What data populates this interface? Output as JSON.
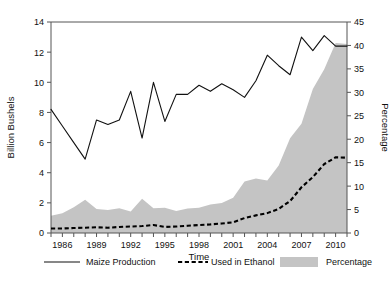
{
  "chart_data": {
    "type": "line",
    "title": "",
    "xlabel": "Time",
    "ylabel": "Billion Bushels",
    "y2label": "Percentage",
    "grid": false,
    "legend_position": "bottom",
    "xlim": [
      1985,
      2011
    ],
    "ylim": [
      0,
      14
    ],
    "y2lim": [
      0,
      45
    ],
    "xticks_labeled": [
      1986,
      1989,
      1992,
      1995,
      1998,
      2001,
      2004,
      2007,
      2010
    ],
    "xticks_all": [
      1985,
      1986,
      1987,
      1988,
      1989,
      1990,
      1991,
      1992,
      1993,
      1994,
      1995,
      1996,
      1997,
      1998,
      1999,
      2000,
      2001,
      2002,
      2003,
      2004,
      2005,
      2006,
      2007,
      2008,
      2009,
      2010,
      2011
    ],
    "yticks": [
      0,
      2,
      4,
      6,
      8,
      10,
      12,
      14
    ],
    "y2ticks": [
      0,
      5,
      10,
      15,
      20,
      25,
      30,
      35,
      40,
      45
    ],
    "x": [
      1985,
      1986,
      1987,
      1988,
      1989,
      1990,
      1991,
      1992,
      1993,
      1994,
      1995,
      1996,
      1997,
      1998,
      1999,
      2000,
      2001,
      2002,
      2003,
      2004,
      2005,
      2006,
      2007,
      2008,
      2009,
      2010,
      2011
    ],
    "series": [
      {
        "name": "Maize Production",
        "axis": "left",
        "style": "solid",
        "color": "#111111",
        "values": [
          8.2,
          7.1,
          6.0,
          4.9,
          7.5,
          7.2,
          7.5,
          9.4,
          6.3,
          10.0,
          7.4,
          9.2,
          9.2,
          9.8,
          9.4,
          9.9,
          9.5,
          9.0,
          10.1,
          11.8,
          11.1,
          10.5,
          13.0,
          12.1,
          13.1,
          12.4,
          12.4
        ]
      },
      {
        "name": "Used in Ethanol",
        "axis": "left",
        "style": "dashed",
        "color": "#000000",
        "values": [
          0.3,
          0.3,
          0.33,
          0.35,
          0.38,
          0.35,
          0.4,
          0.43,
          0.46,
          0.53,
          0.4,
          0.43,
          0.48,
          0.53,
          0.57,
          0.63,
          0.71,
          0.99,
          1.17,
          1.32,
          1.6,
          2.12,
          3.03,
          3.71,
          4.57,
          5.02,
          5.0
        ]
      },
      {
        "name": "Percentage",
        "axis": "right",
        "style": "area",
        "color": "#c4c4c4",
        "values": [
          3.7,
          4.2,
          5.5,
          7.1,
          5.1,
          4.9,
          5.3,
          4.6,
          7.3,
          5.3,
          5.4,
          4.7,
          5.2,
          5.4,
          6.1,
          6.4,
          7.5,
          11.0,
          11.6,
          11.2,
          14.4,
          20.2,
          23.3,
          30.7,
          34.9,
          40.5,
          40.3
        ]
      }
    ]
  },
  "legend": {
    "entries": [
      {
        "label": "Maize  Production",
        "marker": "solid-line"
      },
      {
        "label": "Used in Ethanol",
        "marker": "dashed-line"
      },
      {
        "label": "Percentage",
        "marker": "gray-swatch"
      }
    ]
  },
  "colors": {
    "area_gray": "#c4c4c4",
    "line_black": "#111111",
    "axis_gray": "#555555"
  }
}
